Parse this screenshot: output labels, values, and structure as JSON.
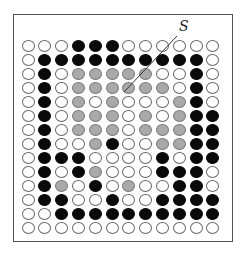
{
  "diagram": {
    "label": "S",
    "rows": 14,
    "cols": 12,
    "legend_colors": {
      "W": "#ffffff",
      "B": "#0a0a0a",
      "G": "#a9a9a9"
    },
    "grid": [
      "WWWBBBWWWWWW",
      "WBBBBBBBBBBW",
      "WBWGGGGGWWBW",
      "WBWGGGGGGWBW",
      "WBWGWGWWWGBW",
      "WBWGGGWGWGBB",
      "WBWGGGWGGGBB",
      "WBWWGBWWGGBB",
      "WBBBWWWWBWBB",
      "WBWBGWWWBBBW",
      "WBGWBWGWWBBW",
      "WBBWWBWWBBBB",
      "WWBBBBBBBBBB",
      "WWWWWWWWWWWW"
    ]
  }
}
